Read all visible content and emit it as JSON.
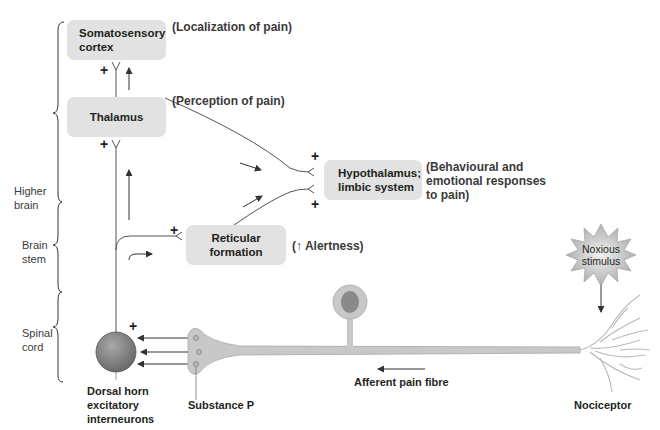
{
  "regions": {
    "higher_brain": "Higher brain",
    "higher_brain_l1": "Higher",
    "higher_brain_l2": "brain",
    "brain_stem_l1": "Brain",
    "brain_stem_l2": "stem",
    "spinal_cord_l1": "Spinal",
    "spinal_cord_l2": "cord"
  },
  "boxes": {
    "somatosensory_l1": "Somatosensory",
    "somatosensory_l2": "cortex",
    "thalamus": "Thalamus",
    "hypothalamus_l1": "Hypothalamus;",
    "hypothalamus_l2": "limbic system",
    "reticular_l1": "Reticular",
    "reticular_l2": "formation"
  },
  "annotations": {
    "localization": "(Localization of pain)",
    "perception": "(Perception of pain)",
    "behavioural_l1": "(Behavioural and",
    "behavioural_l2": "emotional responses",
    "behavioural_l3": "to pain)",
    "alertness": "(↑ Alertness)"
  },
  "captions": {
    "dorsal_l1": "Dorsal horn",
    "dorsal_l2": "excitatory",
    "dorsal_l3": "interneurons",
    "substance_p": "Substance P",
    "afferent": "Afferent pain fibre",
    "nociceptor": "Nociceptor",
    "noxious_l1": "Noxious",
    "noxious_l2": "stimulus"
  },
  "synapse_sign": "+",
  "colors": {
    "box_fill": "#e2e2e2",
    "fibre_fill": "#c8c8c8",
    "soma_fill": "#8a8a8a",
    "line": "#555555"
  }
}
